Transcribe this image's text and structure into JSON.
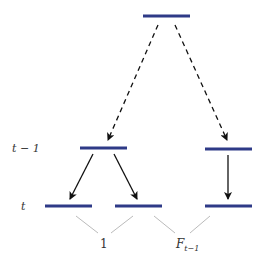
{
  "diagram": {
    "levels": [
      {
        "id": "t-1",
        "label_text": "t − 1"
      },
      {
        "id": "t",
        "label_text": "t"
      }
    ],
    "nodes": [
      {
        "id": "root",
        "level": "top"
      },
      {
        "id": "a",
        "level": "t-1"
      },
      {
        "id": "b",
        "level": "t-1"
      },
      {
        "id": "a1",
        "level": "t"
      },
      {
        "id": "a2",
        "level": "t"
      },
      {
        "id": "b1",
        "level": "t"
      }
    ],
    "edges": [
      {
        "from": "root",
        "to": "a",
        "style": "dashed"
      },
      {
        "from": "root",
        "to": "b",
        "style": "dashed"
      },
      {
        "from": "a",
        "to": "a1",
        "style": "solid"
      },
      {
        "from": "a",
        "to": "a2",
        "style": "solid"
      },
      {
        "from": "b",
        "to": "b1",
        "style": "solid"
      }
    ],
    "braces": [
      {
        "label": "1",
        "covers": [
          "a1",
          "a2"
        ]
      },
      {
        "label_main": "F",
        "label_sub": "t−1",
        "covers": [
          "a2",
          "b1"
        ]
      }
    ],
    "colors": {
      "bar": "#2e3a87",
      "arrow": "#111111",
      "brace": "#bbbbbb"
    }
  }
}
